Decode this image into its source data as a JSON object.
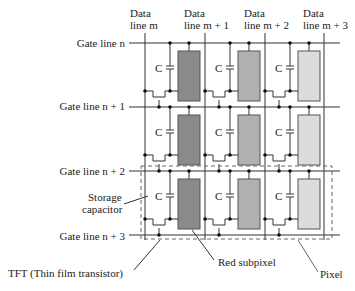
{
  "diagram": {
    "data_lines": [
      {
        "line1": "Data",
        "line2": "line m"
      },
      {
        "line1": "Data",
        "line2": "line m + 1"
      },
      {
        "line1": "Data",
        "line2": "line m + 2"
      },
      {
        "line1": "Data",
        "line2": "line m + 3"
      }
    ],
    "gate_lines": [
      "Gate line n",
      "Gate line n + 1",
      "Gate line n + 2",
      "Gate line n + 3"
    ],
    "capacitor_label": "C",
    "callouts": {
      "storage_line1": "Storage",
      "storage_line2": "capacitor",
      "tft": "TFT (Thin film transistor)",
      "red_subpixel": "Red subpixel",
      "pixel": "Pixel"
    },
    "colors": {
      "red_subpixel": "#8a8a8a",
      "green_subpixel": "#b0b0b0",
      "blue_subpixel": "#dcdcdc",
      "lines": "#333333"
    }
  }
}
